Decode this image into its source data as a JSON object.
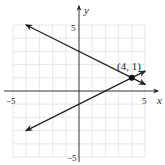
{
  "chart_data": {
    "type": "line",
    "title": "",
    "xlabel": "x",
    "ylabel": "y",
    "xlim": [
      -5,
      5
    ],
    "ylim": [
      -5,
      5
    ],
    "grid": true,
    "x_ticks_labeled": [
      "-5",
      "5"
    ],
    "y_ticks_labeled": [
      "5",
      "-5"
    ],
    "series": [
      {
        "name": "line1",
        "equation": "y = -0.5x + 3",
        "x": [
          -4,
          5
        ],
        "y": [
          5,
          0.5
        ],
        "arrows": "both"
      },
      {
        "name": "line2",
        "equation": "y = 0.5x - 1",
        "x": [
          -4,
          5
        ],
        "y": [
          -3,
          1.5
        ],
        "arrows": "both"
      }
    ],
    "annotations": [
      {
        "point": [
          4,
          1
        ],
        "label": "(4, 1)",
        "marker": "filled-circle"
      }
    ]
  },
  "labels": {
    "x_axis": "x",
    "y_axis": "y",
    "x_neg": "−5",
    "x_pos": "5",
    "y_pos": "5",
    "y_neg": "−5",
    "point": "(4, 1)"
  }
}
